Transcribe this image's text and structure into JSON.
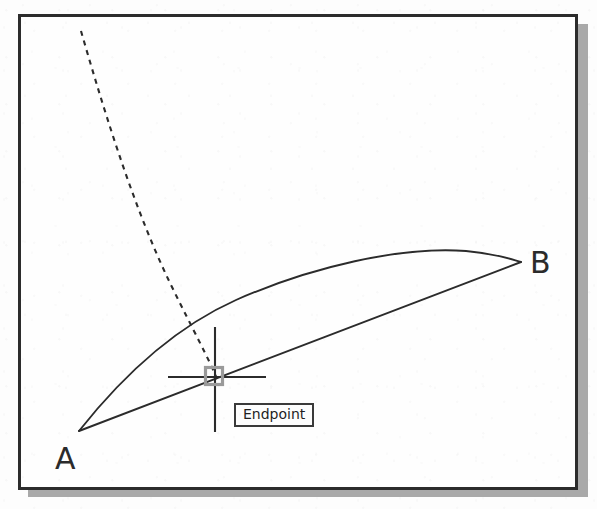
{
  "application": {
    "type": "cad-drawing-viewport",
    "title": "Endpoint object snap",
    "background_color": "#fdfdfd",
    "frame_border_color": "#2c2c2c",
    "frame_shadow_color": "#a9a9a9"
  },
  "drawing": {
    "geometry_color": "#2b2b2b",
    "vertices": [
      {
        "id": "A",
        "label": "A",
        "label_x": 52,
        "label_y": 444,
        "point_x": 76,
        "point_y": 428
      },
      {
        "id": "B",
        "label": "B",
        "label_x": 527,
        "label_y": 248,
        "point_x": 518,
        "point_y": 258
      }
    ],
    "entities": [
      {
        "name": "arc-a-to-b",
        "kind": "arc",
        "style": "solid",
        "description": "Curved arc bulging upward from A to B",
        "path": "M 58 414 C 96 366 150 312 215 283 C 290 250 380 229 445 234 C 478 237 492 243 500 245"
      },
      {
        "name": "line-a-to-b",
        "kind": "line",
        "style": "solid",
        "description": "Straight chord line from A to B passing through the snap point",
        "path": "M 58 414 L 500 245"
      },
      {
        "name": "construction-line",
        "kind": "polyline",
        "style": "dashed",
        "dash_pattern": "5 5",
        "description": "Dashed construction line curving from upper-left down to the endpoint snap",
        "path": "M 60 14 C 78 76 110 186 150 268 C 172 313 188 342 196 362"
      }
    ]
  },
  "cursor": {
    "name": "crosshair-cursor",
    "center_x": 215,
    "center_y": 377,
    "horizontal_span": [
      168,
      266
    ],
    "vertical_span": [
      327,
      432
    ],
    "color": "#2b2b2b"
  },
  "snap_marker": {
    "name": "endpoint-snap-marker",
    "shape": "square",
    "color": "#9a9a9a",
    "center_x": 214,
    "center_y": 376,
    "size": 17
  },
  "tooltip": {
    "label": "Endpoint",
    "x": 231,
    "y": 403,
    "border_color": "#3a3a3a",
    "background_color": "#fdfdfd",
    "text_color": "#1f1f1f"
  }
}
